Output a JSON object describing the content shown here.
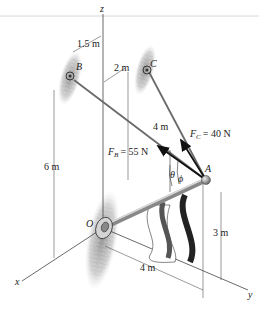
{
  "figure": {
    "axes": {
      "x": "x",
      "y": "y",
      "z": "z"
    },
    "points": {
      "O": "O",
      "A": "A",
      "B": "B",
      "C": "C"
    },
    "forces": {
      "FB": {
        "symbol": "F",
        "subscript": "B",
        "value": "= 55 N"
      },
      "FC": {
        "symbol": "F",
        "subscript": "C",
        "value": "= 40 N"
      }
    },
    "angles": {
      "theta": "θ",
      "phi": "ϕ"
    },
    "dimensions": {
      "B_offset_x": "1.5 m",
      "C_offset": "2 m",
      "height_B": "6 m",
      "height_C": "4 m",
      "height_A": "3 m",
      "length_OA_y": "4 m"
    },
    "colors": {
      "line": "#444444",
      "force_arrow": "#111111",
      "wall": "#8a8a8a",
      "rod": "#b5b5b5",
      "flag_stripe": "#2a2a2a"
    }
  }
}
